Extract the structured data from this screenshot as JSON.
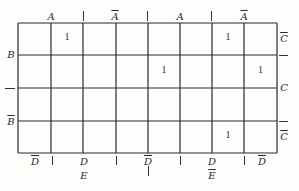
{
  "diagram": {
    "type": "karnaugh-map",
    "variables": [
      "A",
      "B",
      "C",
      "D",
      "E"
    ],
    "grid": {
      "rows": 4,
      "cols": 8
    },
    "top_labels": [
      {
        "text": "A",
        "bar": false,
        "x": 51
      },
      {
        "text": "A",
        "bar": true,
        "x": 115
      },
      {
        "text": "A",
        "bar": false,
        "x": 180
      },
      {
        "text": "A",
        "bar": true,
        "x": 244
      }
    ],
    "top_ticks": [
      83,
      147,
      211
    ],
    "left_labels": [
      {
        "text": "B",
        "bar": false,
        "y": 55
      },
      {
        "text": "B",
        "bar": true,
        "y": 122
      }
    ],
    "left_ticks": [
      88
    ],
    "right_labels": [
      {
        "text": "C",
        "bar": true,
        "y": 39
      },
      {
        "text": "C",
        "bar": false,
        "y": 88
      },
      {
        "text": "C",
        "bar": true,
        "y": 137
      }
    ],
    "right_ticks": [
      55,
      121
    ],
    "bottom_labels": [
      {
        "text": "D",
        "bar": true,
        "x": 35
      },
      {
        "text": "D",
        "bar": false,
        "x": 84
      },
      {
        "text": "D",
        "bar": true,
        "x": 148
      },
      {
        "text": "D",
        "bar": false,
        "x": 212
      },
      {
        "text": "D",
        "bar": true,
        "x": 262
      }
    ],
    "bottom_ticks": [
      52,
      116,
      180,
      244
    ],
    "e_labels": [
      {
        "text": "E",
        "bar": false,
        "x": 84
      },
      {
        "text": "E",
        "bar": true,
        "x": 212
      }
    ],
    "e_ticks": [
      148
    ],
    "cells": [
      [
        "",
        "1",
        "",
        "",
        "",
        "",
        "1",
        ""
      ],
      [
        "",
        "",
        "",
        "",
        "1",
        "",
        "",
        "1"
      ],
      [
        "",
        "",
        "",
        "",
        "",
        "",
        "",
        ""
      ],
      [
        "",
        "",
        "",
        "",
        "",
        "",
        "1",
        ""
      ]
    ],
    "line_color": "#2b2b2b"
  }
}
